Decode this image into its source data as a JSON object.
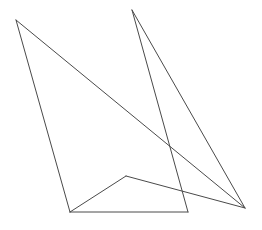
{
  "canvas": {
    "width": 262,
    "height": 230,
    "background_color": "#ffffff"
  },
  "figure": {
    "stroke_color": "#4a4a4a",
    "stroke_width": 1,
    "fill": "none",
    "vertices": {
      "top_left_apex": {
        "x": 16,
        "y": 20
      },
      "top_right_apex": {
        "x": 132,
        "y": 10
      },
      "bottom_left": {
        "x": 70,
        "y": 212
      },
      "bottom_mid_right": {
        "x": 188,
        "y": 212
      },
      "bottom_right_convergence": {
        "x": 245,
        "y": 208
      },
      "inner_peak": {
        "x": 126,
        "y": 176
      }
    },
    "segments": [
      {
        "name": "left-edge",
        "x1": 16,
        "y1": 20,
        "x2": 70,
        "y2": 212
      },
      {
        "name": "long-diagonal-top-left-to-bottom-right",
        "x1": 16,
        "y1": 20,
        "x2": 245,
        "y2": 208
      },
      {
        "name": "bottom-horizontal-base",
        "x1": 70,
        "y1": 212,
        "x2": 188,
        "y2": 212
      },
      {
        "name": "inner-left-rise-to-peak",
        "x1": 70,
        "y1": 212,
        "x2": 126,
        "y2": 176
      },
      {
        "name": "inner-peak-to-bottom-right",
        "x1": 126,
        "y1": 176,
        "x2": 245,
        "y2": 208
      },
      {
        "name": "right-apex-steep-descent",
        "x1": 132,
        "y1": 10,
        "x2": 188,
        "y2": 212
      },
      {
        "name": "right-apex-to-bottom-right",
        "x1": 132,
        "y1": 10,
        "x2": 245,
        "y2": 208
      }
    ]
  }
}
